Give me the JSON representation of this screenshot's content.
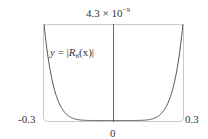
{
  "chart_data": {
    "type": "line",
    "title": "",
    "function_label": "y = |R6(x)|",
    "function_label_parts": {
      "lhs": "y",
      "eq": " = |",
      "R": "R",
      "sub": "6",
      "arg": "(x)|"
    },
    "xlabel": "",
    "ylabel": "",
    "xlim": [
      -0.3,
      0.3
    ],
    "ylim": [
      0,
      4.3e-09
    ],
    "x_tick_labels": [
      "-0.3",
      "0",
      "0.3"
    ],
    "y_max_label": {
      "mantissa": "4.3 × 10",
      "exponent": "−9"
    },
    "grid": false,
    "legend": null,
    "series": [
      {
        "name": "|R6(x)|",
        "x": [
          -0.3,
          -0.28,
          -0.26,
          -0.24,
          -0.22,
          -0.2,
          -0.18,
          -0.15,
          -0.1,
          -0.05,
          0,
          0.05,
          0.1,
          0.15,
          0.18,
          0.2,
          0.22,
          0.24,
          0.26,
          0.28,
          0.3
        ],
        "y": [
          4.3e-09,
          2.66e-09,
          1.58e-09,
          9e-10,
          4.9e-10,
          2.5e-10,
          1.2e-10,
          3.4e-11,
          2e-12,
          1.6e-14,
          0,
          1.6e-14,
          2e-12,
          3.4e-11,
          1.2e-10,
          2.5e-10,
          4.9e-10,
          9e-10,
          1.58e-09,
          2.66e-09,
          4.3e-09
        ]
      }
    ],
    "colors": {
      "curve": "#555555",
      "frame": "#c8c8c8",
      "axis": "#444444"
    }
  }
}
